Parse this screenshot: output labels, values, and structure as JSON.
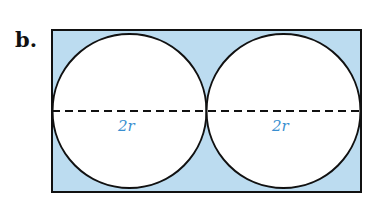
{
  "figure": {
    "label": "b.",
    "dimension_left": "2r",
    "dimension_right": "2r",
    "colors": {
      "fill": "#bcdcf0",
      "stroke": "#111111",
      "dimension_text": "#3a8fd0",
      "circle_fill": "#ffffff"
    }
  }
}
